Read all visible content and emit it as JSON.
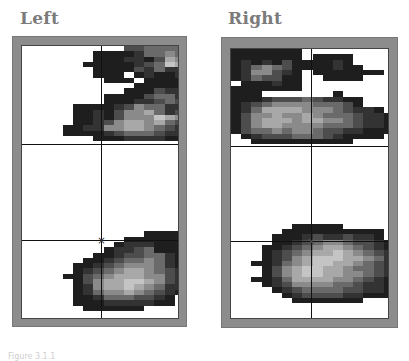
{
  "panels": [
    {
      "title": "Left",
      "crosshair": {
        "x_frac": 0.5,
        "upper_line_frac": 0.355,
        "lower_line_frac": 0.7
      },
      "marker": "×",
      "rows": [
        "..........3344443",
        ".......1111244543",
        ".......1112213652",
        "......11111234761",
        ".......11113242243",
        ".......111.1211232",
        "........111.11111.",
        "...........11111..",
        "..........1113221.",
        "........111134421.",
        "........11122343311",
        ".....111123544221.",
        ".....11213556423.1",
        ".....1121355576521",
        ".....1123566564321",
        "....11225566543211",
        "....1111234443221.",
        ".......111222211..",
        "...................",
        "...................",
        "...................",
        "...................",
        "...................",
        "...................",
        "...................",
        "...................",
        "...................",
        "...................",
        "...................",
        "...................",
        "...................",
        "...................",
        "...................",
        "...................",
        "...................",
        "............1111...",
        "..........111111...",
        ".........12221112..",
        "........122341111..",
        ".......1123344211..",
        "......11234454211..",
        ".....11234555421...",
        ".....12345665432...",
        "....1134566655321...",
        ".....13566776532..1",
        ".....12566765422...",
        ".....12455654321...",
        ".....1124443321....",
        ".....1112222211....",
        "......111111......."
      ]
    },
    {
      "title": "Right",
      "crosshair": {
        "x_frac": 0.53,
        "upper_line_frac": 0.355,
        "lower_line_frac": 0.69
      },
      "marker": "×",
      "rows": [
        "1111111............",
        "1111111.1111.......",
        "121213111121.......",
        "1245431111211......",
        "1255321.1111111....",
        "1243311..1111......",
        ".111211...........",
        "1111111...........",
        "111.......1.......",
        "1112333432211......",
        "1234555544431......",
        "124666655543221....",
        "13556556544432211..",
        "1356665665543221...",
        "13566555544432211..",
        "1344545543322111.1.",
        ".12333444321111....",
        "..1111111111.......",
        "...................",
        "...................",
        "...................",
        "...................",
        "...................",
        "...................",
        "...................",
        "...................",
        "...................",
        "...................",
        "...................",
        "...................",
        "...................",
        "...................",
        "...................",
        "......11111........",
        ".....1111111111....",
        "....11123223221....",
        "....112345543321...",
        "...11234566543211..",
        "...123456676543221.",
        "...123567776654221.",
        "..11245677665432211",
        "...1356776654432211",
        "...135677665543211.",
        "..112466665543211..",
        "...12355554432211..",
        "....1234444332211...",
        ".....12333322111....",
        "......1111111......."
      ]
    }
  ],
  "palette": {
    "1": "#1e1e1e",
    "2": "#333333",
    "3": "#4d4d4d",
    "4": "#6a6a6a",
    "5": "#8a8a8a",
    "6": "#a8a8a8",
    "7": "#c4c4c4"
  },
  "caption": "Figure 3.1.1"
}
